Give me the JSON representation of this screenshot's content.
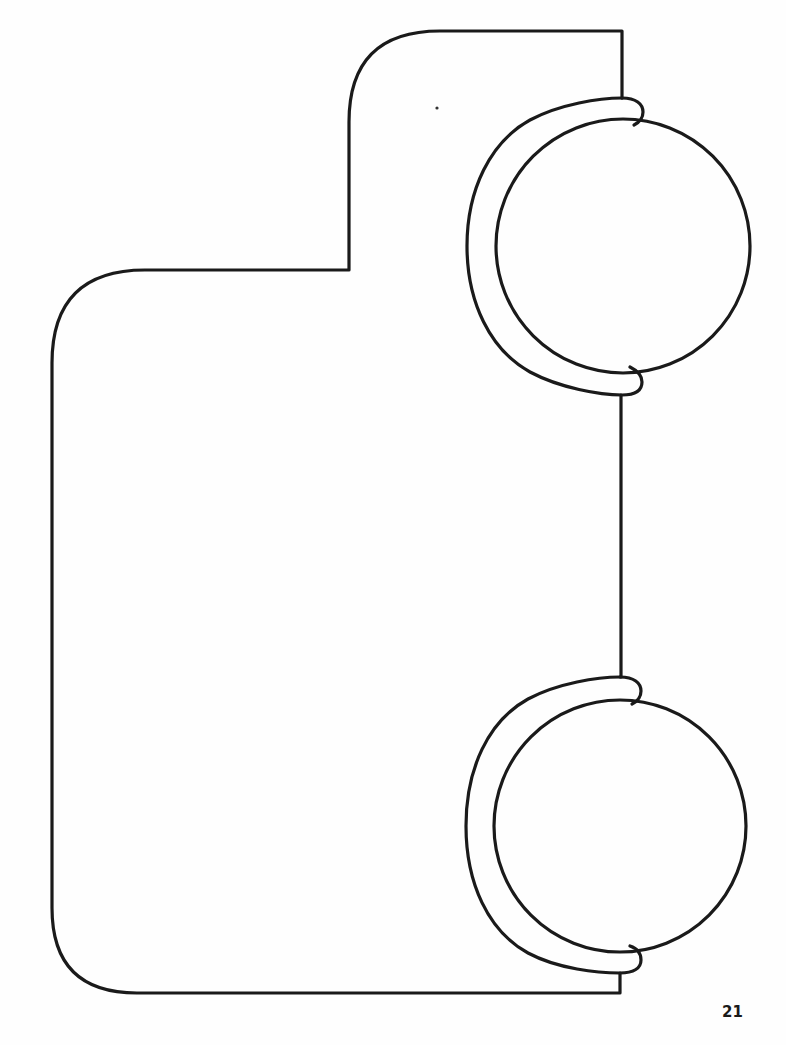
{
  "page": {
    "page_number": "21",
    "background_color": "#ffffff",
    "stroke_color": "#1a1a1a"
  },
  "drawing": {
    "description": "Outline template of a body shape with a stepped top-left notch and two globe-like circles with C-shaped brackets on the right edge",
    "outline": {
      "name": "body-outline",
      "shape": "stepped rounded rectangle"
    },
    "circles": [
      {
        "name": "upper-globe",
        "center": [
          623,
          246
        ],
        "radius": 127,
        "bracket": "C-shaped arc with rounded end caps"
      },
      {
        "name": "lower-globe",
        "center": [
          620,
          826
        ],
        "radius": 126,
        "bracket": "C-shaped arc with rounded end caps"
      }
    ]
  }
}
